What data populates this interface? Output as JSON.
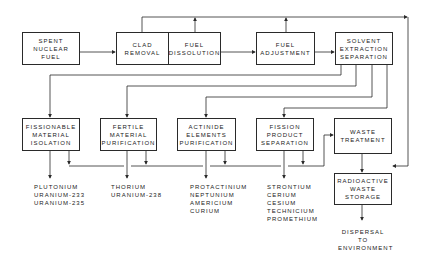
{
  "boxes": {
    "spent_fuel": [
      "SPENT",
      "NUCLEAR",
      "FUEL"
    ],
    "clad_removal": [
      "CLAD",
      "REMOVAL"
    ],
    "fuel_dissolution": [
      "FUEL",
      "DISSOLUTION"
    ],
    "fuel_adjustment": [
      "FUEL",
      "ADJUSTMENT"
    ],
    "solvent_extraction": [
      "SOLVENT",
      "EXTRACTION",
      "SEPARATION"
    ],
    "fissionable": [
      "FISSIONABLE",
      "MATERIAL",
      "ISOLATION"
    ],
    "fertile": [
      "FERTILE",
      "MATERIAL",
      "PURIFICATION"
    ],
    "actinide": [
      "ACTINIDE",
      "ELEMENTS",
      "PURIFICATION"
    ],
    "fission_product": [
      "FISSION",
      "PRODUCT",
      "SEPARATION"
    ],
    "waste_treatment": [
      "WASTE",
      "TREATMENT"
    ],
    "waste_storage": [
      "RADIOACTIVE",
      "WASTE",
      "STORAGE"
    ]
  },
  "outputs": {
    "fissionable": [
      "PLUTONIUM",
      "URANIUM-233",
      "URANIUM-235"
    ],
    "fertile": [
      "THORIUM",
      "URANIUM-238"
    ],
    "actinide": [
      "PROTACTINIUM",
      "NEPTUNIUM",
      "AMERICIUM",
      "CURIUM"
    ],
    "fission_product": [
      "STRONTIUM",
      "CERIUM",
      "CESIUM",
      "TECHNICIUM",
      "PROMETHIUM"
    ],
    "dispersal": [
      "DISPERSAL",
      "TO",
      "ENVIRONMENT"
    ]
  },
  "colors": {
    "line": "#2a2a2a",
    "background": "#ffffff"
  }
}
